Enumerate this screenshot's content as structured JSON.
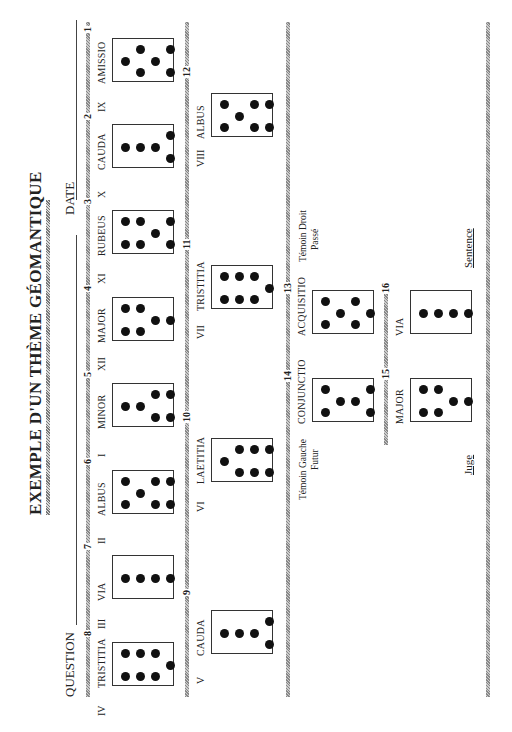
{
  "title": "EXEMPLE D'UN THÈME GÉOMANTIQUE",
  "form_fields": {
    "date_label": "DATE",
    "question_label": "QUESTION"
  },
  "houses": [
    {
      "house": "1",
      "roman": "IX",
      "name": "AMISSIO",
      "rows": [
        1,
        2,
        1,
        2
      ]
    },
    {
      "house": "2",
      "roman": "X",
      "name": "CAUDA",
      "rows": [
        1,
        1,
        1,
        2
      ]
    },
    {
      "house": "3",
      "roman": "XI",
      "name": "RUBEUS",
      "rows": [
        2,
        2,
        1,
        2
      ]
    },
    {
      "house": "4",
      "roman": "XII",
      "name": "MAJOR",
      "rows": [
        2,
        2,
        1,
        1
      ]
    },
    {
      "house": "5",
      "roman": "I",
      "name": "MINOR",
      "rows": [
        1,
        1,
        2,
        2
      ]
    },
    {
      "house": "6",
      "roman": "II",
      "name": "ALBUS",
      "rows": [
        2,
        1,
        2,
        2
      ]
    },
    {
      "house": "7",
      "roman": "III",
      "name": "VIA",
      "rows": [
        1,
        1,
        1,
        1
      ]
    },
    {
      "house": "8",
      "roman": "IV",
      "name": "TRISTITIA",
      "rows": [
        2,
        2,
        2,
        1
      ]
    }
  ],
  "nieces": [
    {
      "house": "9",
      "roman": "V",
      "name": "CAUDA",
      "rows": [
        1,
        1,
        1,
        2
      ]
    },
    {
      "house": "10",
      "roman": "VI",
      "name": "LAETITIA",
      "rows": [
        1,
        2,
        2,
        2
      ]
    },
    {
      "house": "11",
      "roman": "VII",
      "name": "TRISTITIA",
      "rows": [
        2,
        2,
        2,
        1
      ]
    },
    {
      "house": "12",
      "roman": "VIII",
      "name": "ALBUS",
      "rows": [
        2,
        1,
        2,
        2
      ]
    }
  ],
  "witnesses": [
    {
      "house": "13",
      "name": "ACQUISITIO",
      "rows": [
        2,
        1,
        2,
        1
      ],
      "label": "Témoin Droit",
      "sublabel": "Passé"
    },
    {
      "house": "14",
      "name": "CONJUNCTIO",
      "rows": [
        2,
        1,
        1,
        2
      ],
      "label": "Témoin Gauche",
      "sublabel": "Futur"
    }
  ],
  "judges": [
    {
      "house": "15",
      "name": "MAJOR",
      "rows": [
        2,
        2,
        1,
        1
      ],
      "label": "Juge"
    },
    {
      "house": "16",
      "name": "VIA",
      "rows": [
        1,
        1,
        1,
        1
      ],
      "label": "Sentence"
    }
  ]
}
